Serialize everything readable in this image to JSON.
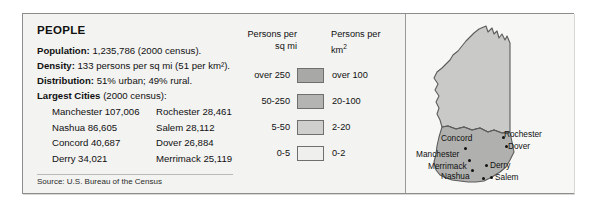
{
  "panel": {
    "title": "PEOPLE",
    "facts": [
      {
        "label": "Population:",
        "value": "1,235,786 (2000 census)."
      },
      {
        "label": "Density:",
        "value": "133 persons per sq mi (51 per km²)."
      },
      {
        "label": "Distribution:",
        "value": "51% urban; 49% rural."
      }
    ],
    "cities_heading_label": "Largest Cities",
    "cities_heading_suffix": "(2000 census):",
    "cities": [
      {
        "left": "Manchester 107,006",
        "right": "Rochester 28,461"
      },
      {
        "left": "Nashua 86,605",
        "right": "Salem 28,112"
      },
      {
        "left": "Concord 40,687",
        "right": "Dover 26,884"
      },
      {
        "left": "Derry 34,021",
        "right": "Merrimack 25,119"
      }
    ],
    "source": "Source: U.S. Bureau of the Census"
  },
  "legend": {
    "header_left_line1": "Persons per",
    "header_left_line2": "sq mi",
    "header_right_line1": "Persons per",
    "header_right_line2_base": "km",
    "header_right_line2_sup": "2",
    "rows": [
      {
        "sq_mi": "over 250",
        "km2": "over 100",
        "color": "#a8a8a6"
      },
      {
        "sq_mi": "50-250",
        "km2": "20-100",
        "color": "#b4b4b2"
      },
      {
        "sq_mi": "5-50",
        "km2": "2-20",
        "color": "#cfcfcd"
      },
      {
        "sq_mi": "0-5",
        "km2": "0-2",
        "color": "#efefed"
      }
    ]
  },
  "map": {
    "state_fill_light": "#c9c9c7",
    "state_fill_dark": "#b0b0ae",
    "state_outline": "#5c5c5c",
    "cities": [
      {
        "name": "Concord",
        "label_x": 35,
        "label_y": 120,
        "dot_x": 58,
        "dot_y": 133
      },
      {
        "name": "Manchester",
        "label_x": 10,
        "label_y": 136,
        "dot_x": 62,
        "dot_y": 145
      },
      {
        "name": "Merrimack",
        "label_x": 22,
        "label_y": 148,
        "dot_x": 65,
        "dot_y": 155
      },
      {
        "name": "Nashua",
        "label_x": 35,
        "label_y": 158,
        "dot_x": 76,
        "dot_y": 163
      },
      {
        "name": "Derry",
        "label_x": 84,
        "label_y": 147,
        "dot_x": 79,
        "dot_y": 150
      },
      {
        "name": "Salem",
        "label_x": 89,
        "label_y": 159,
        "dot_x": 84,
        "dot_y": 162
      },
      {
        "name": "Rochester",
        "label_x": 98,
        "label_y": 116,
        "dot_x": 96,
        "dot_y": 122
      },
      {
        "name": "Dover",
        "label_x": 102,
        "label_y": 128,
        "dot_x": 99,
        "dot_y": 131
      }
    ]
  }
}
